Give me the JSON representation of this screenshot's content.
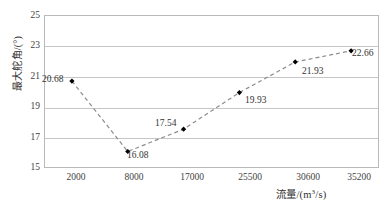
{
  "chart_data": {
    "type": "line",
    "title": "",
    "xlabel": "流量/(m³/s)",
    "ylabel": "最大舵角/(°)",
    "categories": [
      "2000",
      "8000",
      "17000",
      "25500",
      "30600",
      "35200"
    ],
    "values": [
      20.68,
      16.08,
      17.54,
      19.93,
      21.93,
      22.66
    ],
    "point_labels": [
      "20.68",
      "16.08",
      "17.54",
      "19.93",
      "21.93",
      "22.66"
    ],
    "yticks": [
      "25",
      "23",
      "21",
      "19",
      "17",
      "15"
    ],
    "ylim": [
      15,
      25
    ],
    "grid": "horizontal",
    "legend": "none",
    "line_style": "dashed",
    "line_color": "#8c8c8c",
    "marker": "diamond",
    "marker_color": "#000000",
    "background": "#ffffff",
    "frame_color": "#b9b9b9"
  },
  "axis": {
    "x_title_prefix": "流量/(m",
    "x_title_sup": "3",
    "x_title_suffix": "/s)",
    "y_title": "最大舵角/(°)"
  }
}
